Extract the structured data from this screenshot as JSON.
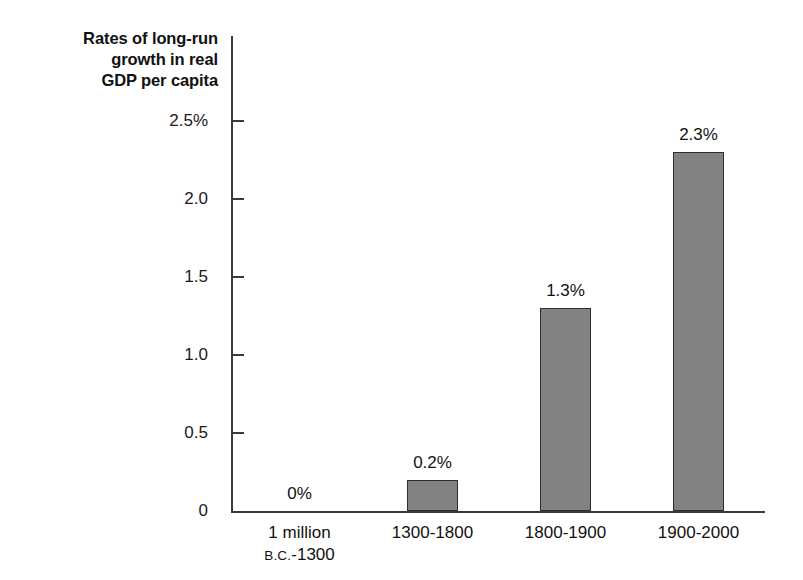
{
  "chart_data": {
    "type": "bar",
    "title": "Rates of long-run growth in real GDP per capita",
    "title_lines": [
      "Rates of long-run",
      "growth in real",
      "GDP per capita"
    ],
    "xlabel": "",
    "ylabel": "",
    "ylim": [
      0,
      2.5
    ],
    "grid": false,
    "legend": null,
    "units": "percent",
    "categories": [
      "1 million B.C.-1300",
      "1300-1800",
      "1800-1900",
      "1900-2000"
    ],
    "category_lines": [
      [
        "1 million",
        "B.C.-1300"
      ],
      [
        "1300-1800",
        ""
      ],
      [
        "1800-1900",
        ""
      ],
      [
        "1900-2000",
        ""
      ]
    ],
    "values": [
      0,
      0.2,
      1.3,
      2.3
    ],
    "value_labels": [
      "0%",
      "0.2%",
      "1.3%",
      "2.3%"
    ],
    "y_ticks": [
      0,
      0.5,
      1.0,
      1.5,
      2.0,
      2.5
    ],
    "y_tick_labels": [
      "0",
      "0.5",
      "1.0",
      "1.5",
      "2.0",
      "2.5%"
    ],
    "colors": {
      "bar_fill": "#828282",
      "bar_edge": "#2e2e2e",
      "axis": "#3a3a3a",
      "text": "#111111",
      "background": "#ffffff"
    }
  }
}
